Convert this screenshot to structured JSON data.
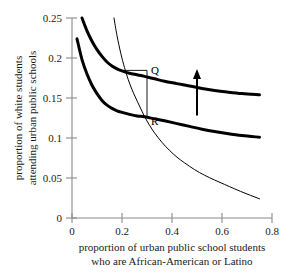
{
  "chart_data": {
    "type": "line",
    "title": "",
    "xlabel": [
      "proportion of urban public school students",
      "who are African-American or Latino"
    ],
    "ylabel": [
      "proportion of white students",
      "attending urban public schools"
    ],
    "xlim": [
      0,
      0.8
    ],
    "ylim": [
      0,
      0.25
    ],
    "xticks": [
      "0",
      "0.2",
      "0.4",
      "0.6",
      "0.8"
    ],
    "xtick_values": [
      0,
      0.2,
      0.4,
      0.6,
      0.8
    ],
    "yticks": [
      "0",
      "0.05",
      "0.1",
      "0.15",
      "0.2",
      "0.25"
    ],
    "ytick_values": [
      0,
      0.05,
      0.1,
      0.15,
      0.2,
      0.25
    ],
    "grid": false,
    "legend": "none",
    "series": [
      {
        "name": "upper-thick-curve",
        "style": "thick",
        "points": [
          [
            0.04,
            0.25
          ],
          [
            0.06,
            0.234
          ],
          [
            0.08,
            0.221
          ],
          [
            0.1,
            0.2105
          ],
          [
            0.12,
            0.202
          ],
          [
            0.14,
            0.195
          ],
          [
            0.16,
            0.19
          ],
          [
            0.18,
            0.1865
          ],
          [
            0.2,
            0.184
          ],
          [
            0.23,
            0.181
          ],
          [
            0.26,
            0.179
          ],
          [
            0.29,
            0.177
          ],
          [
            0.33,
            0.174
          ],
          [
            0.37,
            0.171
          ],
          [
            0.42,
            0.168
          ],
          [
            0.47,
            0.165
          ],
          [
            0.52,
            0.162
          ],
          [
            0.57,
            0.1595
          ],
          [
            0.62,
            0.1575
          ],
          [
            0.68,
            0.1555
          ],
          [
            0.75,
            0.154
          ]
        ]
      },
      {
        "name": "lower-thick-curve",
        "style": "thick",
        "points": [
          [
            0.02,
            0.224
          ],
          [
            0.04,
            0.198
          ],
          [
            0.06,
            0.18
          ],
          [
            0.08,
            0.166
          ],
          [
            0.1,
            0.1555
          ],
          [
            0.12,
            0.147
          ],
          [
            0.14,
            0.141
          ],
          [
            0.16,
            0.137
          ],
          [
            0.18,
            0.134
          ],
          [
            0.2,
            0.132
          ],
          [
            0.23,
            0.1295
          ],
          [
            0.26,
            0.1275
          ],
          [
            0.29,
            0.1265
          ],
          [
            0.33,
            0.124
          ],
          [
            0.37,
            0.1215
          ],
          [
            0.42,
            0.118
          ],
          [
            0.47,
            0.1145
          ],
          [
            0.52,
            0.111
          ],
          [
            0.57,
            0.108
          ],
          [
            0.62,
            0.1055
          ],
          [
            0.68,
            0.103
          ],
          [
            0.75,
            0.101
          ]
        ]
      },
      {
        "name": "thin-demand-curve",
        "style": "thin",
        "points": [
          [
            0.168,
            0.25
          ],
          [
            0.18,
            0.228
          ],
          [
            0.195,
            0.206
          ],
          [
            0.21,
            0.188
          ],
          [
            0.225,
            0.173
          ],
          [
            0.24,
            0.1605
          ],
          [
            0.255,
            0.15
          ],
          [
            0.27,
            0.14
          ],
          [
            0.29,
            0.127
          ],
          [
            0.31,
            0.116
          ],
          [
            0.33,
            0.1065
          ],
          [
            0.36,
            0.0945
          ],
          [
            0.39,
            0.0845
          ],
          [
            0.42,
            0.076
          ],
          [
            0.45,
            0.069
          ],
          [
            0.49,
            0.0605
          ],
          [
            0.53,
            0.0535
          ],
          [
            0.57,
            0.0475
          ],
          [
            0.61,
            0.042
          ],
          [
            0.65,
            0.0365
          ],
          [
            0.7,
            0.03
          ],
          [
            0.75,
            0.024
          ]
        ]
      }
    ],
    "annotations": [
      {
        "name": "point-q",
        "label": "Q",
        "x": 0.3,
        "y": 0.177,
        "label_dx": 4,
        "label_dy": -2
      },
      {
        "name": "point-r",
        "label": "R",
        "x": 0.3,
        "y": 0.127,
        "label_dx": 4,
        "label_dy": 9
      },
      {
        "name": "shift-arrow",
        "label": "",
        "x": 0.5,
        "y_from": 0.128,
        "y_to": 0.185
      }
    ],
    "connector": {
      "name": "qr-connector",
      "horizontal": {
        "x_from": 0.202,
        "x_to": 0.3,
        "y": 0.1845
      },
      "vertical": {
        "x": 0.3,
        "y_from": 0.1845,
        "y_to": 0.1255
      }
    },
    "colors": {
      "curve_thick": "#000000",
      "curve_thin": "#000000",
      "axis": "#8a8a8a",
      "text": "#1a1a1a",
      "background": "#ffffff"
    }
  }
}
